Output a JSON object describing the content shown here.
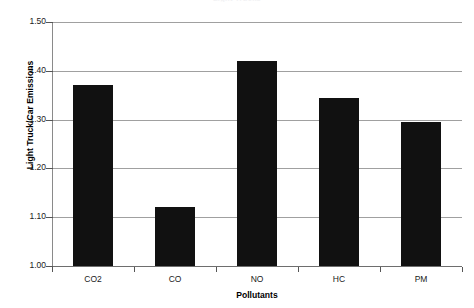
{
  "chart_data": {
    "type": "bar",
    "title": "Light Trucks",
    "categories": [
      "CO2",
      "CO",
      "NO",
      "HC",
      "PM"
    ],
    "values": [
      1.37,
      1.12,
      1.42,
      1.345,
      1.295
    ],
    "xlabel": "Pollutants",
    "ylabel": "Light Truck/Car Emissions",
    "ylim": [
      1.0,
      1.5
    ],
    "yticks": [
      1.0,
      1.1,
      1.2,
      1.3,
      1.4,
      1.5
    ],
    "ytick_labels": [
      "1.00",
      "1.10",
      "1.20",
      "1.30",
      "1.40",
      "1.50"
    ],
    "grid": true,
    "legend": null,
    "bar_color": "#111111",
    "grid_color": "#a0a0a0",
    "axis_color": "#555555"
  }
}
